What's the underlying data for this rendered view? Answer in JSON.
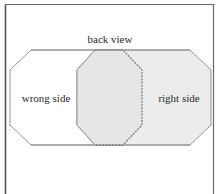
{
  "figure": {
    "title": "back view",
    "labels": {
      "left": "wrong side",
      "right": "right side"
    },
    "shapes": [
      {
        "name": "wrong-side-panel",
        "fill": "#ffffff",
        "stroke": "#8a8a8a"
      },
      {
        "name": "right-side-panel",
        "fill": "#ececec",
        "stroke": "#8a8a8a"
      },
      {
        "name": "overlap-panel",
        "fill": "#e6e6e6",
        "stroke": "#8a8a8a",
        "dashed_edge_color": "#7a7a7a"
      }
    ],
    "colors": {
      "frame": "#6a6a6a",
      "background": "#ffffff",
      "text": "#2a2a2a"
    }
  }
}
